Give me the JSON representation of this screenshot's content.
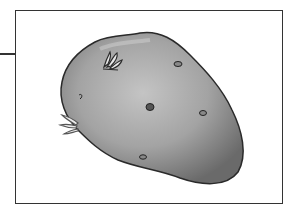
{
  "figure": {
    "colors": {
      "frame": "#333333",
      "potato_light": "#b8b8b8",
      "potato_dark": "#6e6e6e",
      "outline": "#2a2a2a"
    }
  }
}
